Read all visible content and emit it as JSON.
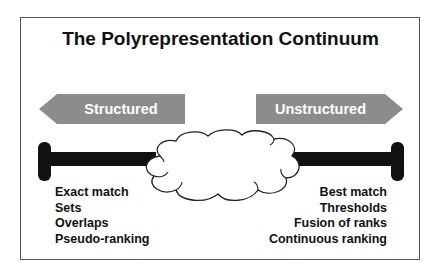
{
  "diagram": {
    "title": "The Polyrepresentation Continuum",
    "left_arrow": {
      "label": "Structured",
      "direction": "left",
      "color": "#8c8c8c"
    },
    "right_arrow": {
      "label": "Unstructured",
      "direction": "right",
      "color": "#8c8c8c"
    },
    "continuum_bar_color": "#111111",
    "center_shape": "cloud",
    "left_items": [
      "Exact match",
      "Sets",
      "Overlaps",
      "Pseudo-ranking"
    ],
    "right_items": [
      "Best match",
      "Thresholds",
      "Fusion of ranks",
      "Continuous ranking"
    ]
  }
}
